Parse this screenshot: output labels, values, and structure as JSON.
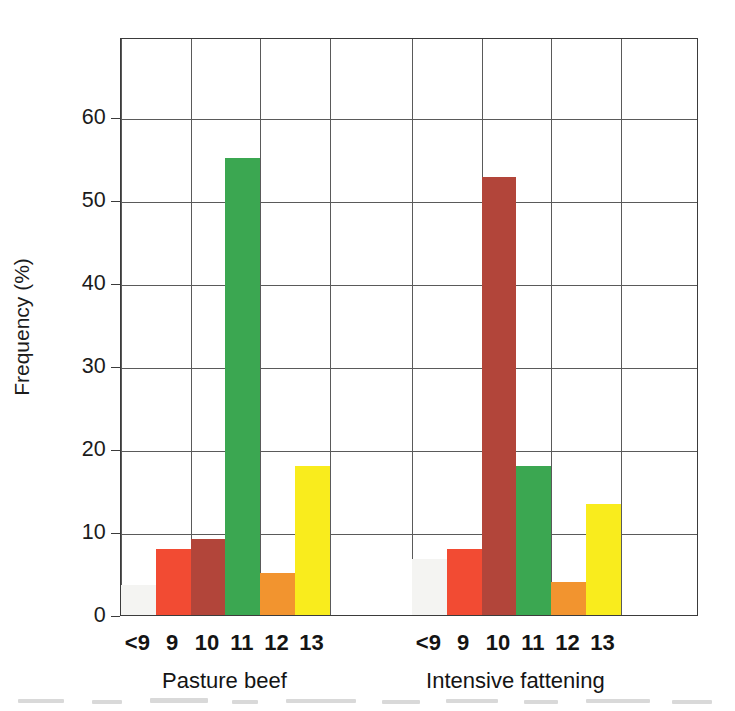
{
  "chart_data": {
    "type": "bar",
    "title": "",
    "xlabel": "",
    "ylabel": "Frequency (%)",
    "ylim": [
      0,
      69.6
    ],
    "yticks": [
      0,
      10,
      20,
      30,
      40,
      50,
      60
    ],
    "ytick_labels": [
      "0",
      "10",
      "20",
      "30",
      "40",
      "50",
      "60"
    ],
    "grid": "horizontal gridlines at each 10% tick plus vertical gridlines at category-pair boundaries",
    "legend": "none",
    "categories": [
      "<9",
      "9",
      "10",
      "11",
      "12",
      "13"
    ],
    "groups": [
      {
        "name": "Pasture beef",
        "values": [
          3.6,
          8.0,
          9.2,
          55.0,
          5.0,
          18.0
        ]
      },
      {
        "name": "Intensive fattening",
        "values": [
          6.8,
          8.0,
          52.8,
          18.0,
          4.0,
          13.4
        ]
      }
    ],
    "bar_colors": {
      "<9": "#f4f4f2",
      "9": "#f24b33",
      "10": "#b2453a",
      "11": "#3ba751",
      "12": "#f2942f",
      "13": "#f9ec1d"
    }
  },
  "axes": {
    "y_title": "Frequency (%)",
    "y_ticks": [
      "0",
      "10",
      "20",
      "30",
      "40",
      "50",
      "60"
    ],
    "x_group_labels": [
      "Pasture beef",
      "Intensive fattening"
    ],
    "x_tick_labels_group1": [
      "<9",
      "9",
      "10",
      "11",
      "12",
      "13"
    ],
    "x_tick_labels_group2": [
      "<9",
      "9",
      "10",
      "11",
      "12",
      "13"
    ]
  },
  "style": {
    "axis_color": "#3b3b3b",
    "grid_color": "#5a5a5a",
    "text_color": "#1b1b1b",
    "background": "#ffffff"
  }
}
